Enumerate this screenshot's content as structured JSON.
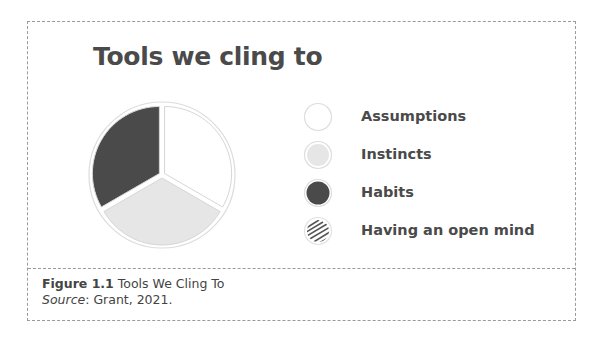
{
  "figure": {
    "title": "Tools we cling to",
    "caption": {
      "label": "Figure 1.1",
      "text": " Tools We Cling To",
      "source_label": "Source",
      "source_text": ": Grant, 2021."
    }
  },
  "legend": {
    "items": [
      {
        "label": "Assumptions",
        "swatch": "white"
      },
      {
        "label": "Instincts",
        "swatch": "light-gray"
      },
      {
        "label": "Habits",
        "swatch": "dark-gray"
      },
      {
        "label": "Having an open mind",
        "swatch": "hatched"
      }
    ]
  },
  "colors": {
    "assumptions": "#ffffff",
    "instincts": "#e6e6e6",
    "habits": "#4a4a4a",
    "outline": "#d8d8d8",
    "hatch": "#555555"
  },
  "chart_data": {
    "type": "pie",
    "title": "Tools we cling to",
    "categories": [
      "Assumptions",
      "Instincts",
      "Habits",
      "Having an open mind"
    ],
    "values": [
      33.3,
      33.3,
      33.3,
      0
    ],
    "colors": [
      "#ffffff",
      "#e6e6e6",
      "#4a4a4a",
      "hatched"
    ],
    "legend_position": "right",
    "caption": "Figure 1.1 Tools We Cling To",
    "source": "Source: Grant, 2021."
  }
}
